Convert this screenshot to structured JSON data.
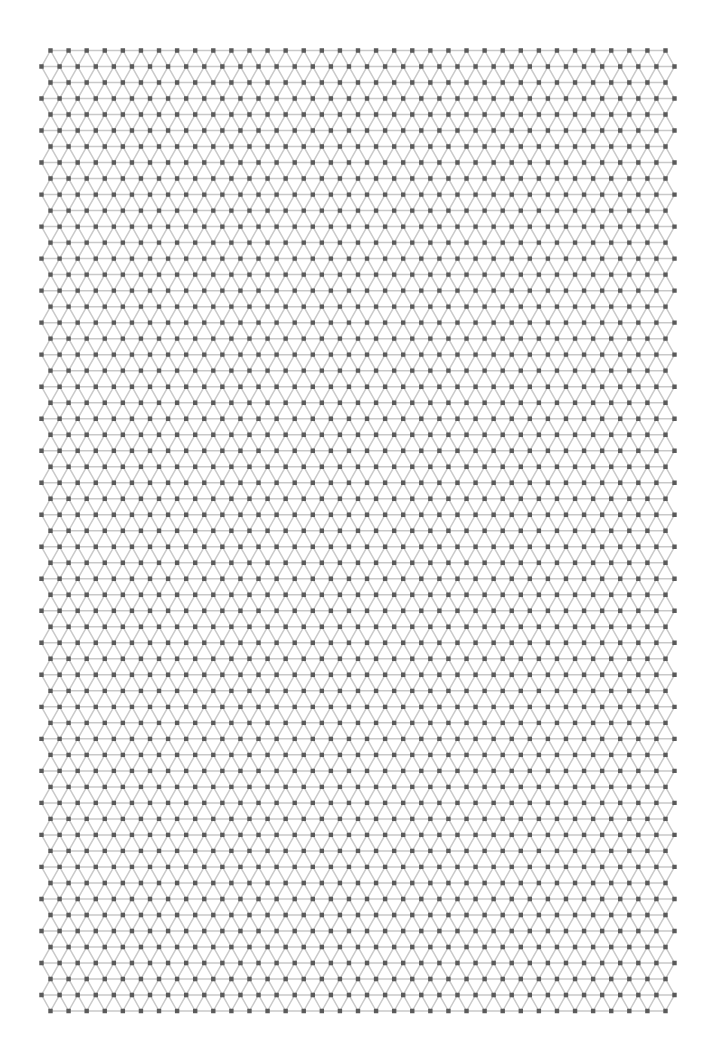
{
  "diagram": {
    "type": "triangular-lattice-graph",
    "rows": 61,
    "row_a": {
      "count": 35,
      "x_start": 50.5,
      "x_end": 665.5
    },
    "row_b": {
      "count": 36,
      "x_start": 41.5,
      "x_end": 674.5
    },
    "y_start": 50.5,
    "y_end": 1011,
    "first_row_type": "A",
    "node_color": "#5a5a5a",
    "node_size": 4.4,
    "edge_color": "#c9c9c9",
    "edge_width": 1.5,
    "background": "#ffffff"
  }
}
